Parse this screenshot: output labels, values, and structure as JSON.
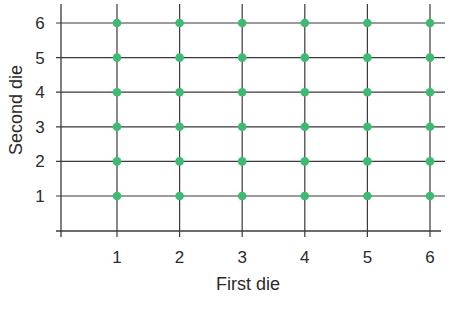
{
  "chart_data": {
    "type": "scatter",
    "title": "",
    "xlabel": "First die",
    "ylabel": "Second die",
    "x_ticks": [
      1,
      2,
      3,
      4,
      5,
      6
    ],
    "y_ticks": [
      1,
      2,
      3,
      4,
      5,
      6
    ],
    "xlim": [
      0.1,
      6.2
    ],
    "ylim": [
      0.05,
      6.5
    ],
    "grid": true,
    "legend": null,
    "series": [
      {
        "name": "Outcomes",
        "color": "#3dbb72",
        "points": [
          [
            1,
            1
          ],
          [
            2,
            1
          ],
          [
            3,
            1
          ],
          [
            4,
            1
          ],
          [
            5,
            1
          ],
          [
            6,
            1
          ],
          [
            1,
            2
          ],
          [
            2,
            2
          ],
          [
            3,
            2
          ],
          [
            4,
            2
          ],
          [
            5,
            2
          ],
          [
            6,
            2
          ],
          [
            1,
            3
          ],
          [
            2,
            3
          ],
          [
            3,
            3
          ],
          [
            4,
            3
          ],
          [
            5,
            3
          ],
          [
            6,
            3
          ],
          [
            1,
            4
          ],
          [
            2,
            4
          ],
          [
            3,
            4
          ],
          [
            4,
            4
          ],
          [
            5,
            4
          ],
          [
            6,
            4
          ],
          [
            1,
            5
          ],
          [
            2,
            5
          ],
          [
            3,
            5
          ],
          [
            4,
            5
          ],
          [
            5,
            5
          ],
          [
            6,
            5
          ],
          [
            1,
            6
          ],
          [
            2,
            6
          ],
          [
            3,
            6
          ],
          [
            4,
            6
          ],
          [
            5,
            6
          ],
          [
            6,
            6
          ]
        ]
      }
    ]
  },
  "colors": {
    "grid": "#3a3a3a",
    "point": "#3dbb72",
    "text": "#2b2b2b"
  }
}
